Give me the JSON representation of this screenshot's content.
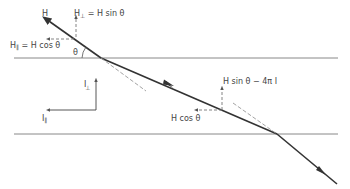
{
  "diagram": {
    "colors": {
      "ray": "#333333",
      "boundary": "#888888",
      "dashed": "#999999",
      "text": "#444444",
      "background": "#ffffff"
    },
    "labels": {
      "H": "H",
      "H_perp": "H",
      "H_perp_sub": "⊥",
      "H_perp_eq": " = H sin θ",
      "H_par": "H",
      "H_par_sub": "∥",
      "H_par_eq": " = H cos θ",
      "theta": "θ",
      "I_perp": "I",
      "I_perp_sub": "⊥",
      "I_par": "I",
      "I_par_sub": "∥",
      "H_sin_minus": "H sin θ − 4π I",
      "H_cos_lower": "H cos θ"
    }
  }
}
